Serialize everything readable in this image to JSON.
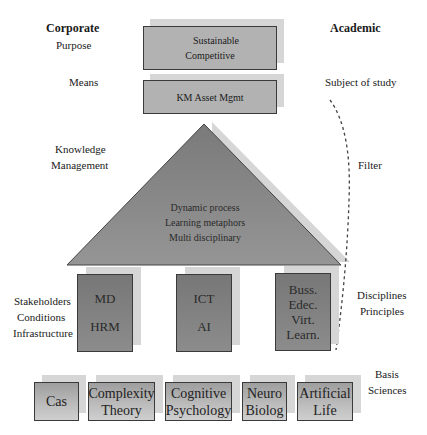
{
  "headers": {
    "left": "Corporate",
    "right": "Academic"
  },
  "left_labels": {
    "purpose": "Purpose",
    "means": "Means",
    "km": [
      "Knowledge",
      "Management"
    ],
    "stakeholders": [
      "Stakeholders",
      "Conditions",
      "Infrastructure"
    ]
  },
  "right_labels": {
    "subject": "Subject of study",
    "filter": "Filter",
    "disciplines": [
      "Disciplines",
      "Principles"
    ],
    "basis": [
      "Basis",
      "Sciences"
    ]
  },
  "top_box": {
    "lines": [
      "Sustainable",
      "Competitive"
    ]
  },
  "means_box": {
    "label": "KM Asset Mgmt"
  },
  "triangle": {
    "lines": [
      "Dynamic process",
      "Learning metaphors",
      "Multi disciplinary"
    ]
  },
  "pillars": [
    {
      "lines": [
        "MD",
        "HRM"
      ]
    },
    {
      "lines": [
        "ICT",
        "AI"
      ]
    },
    {
      "lines": [
        "Buss.",
        "Edec.",
        "Virt.",
        "Learn."
      ]
    }
  ],
  "foundation": [
    {
      "lines": [
        "Cas"
      ]
    },
    {
      "lines": [
        "Complexity",
        "Theory"
      ]
    },
    {
      "lines": [
        "Cognitive",
        "Psychology"
      ]
    },
    {
      "lines": [
        "Neuro",
        "Biolog"
      ]
    },
    {
      "lines": [
        "Artificial",
        "Life"
      ]
    }
  ],
  "colors": {
    "box_border": "#3a3a3a",
    "shadow": "#d6d6d6",
    "pillar_fill": "#808080",
    "triangle_fill": "#8a8a8a"
  }
}
